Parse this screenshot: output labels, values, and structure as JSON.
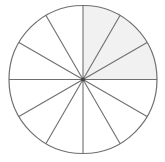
{
  "diagram": {
    "type": "fraction-circle",
    "total_sectors": 12,
    "shaded_sectors": [
      0,
      1,
      2
    ],
    "shaded_fraction": "3/12",
    "center": [
      83,
      79.5
    ],
    "radius": 74,
    "colors": {
      "stroke": "#6f6f6f",
      "shade": "#f1f1f1",
      "background": "#ffffff",
      "center_dot": "#444444"
    }
  }
}
